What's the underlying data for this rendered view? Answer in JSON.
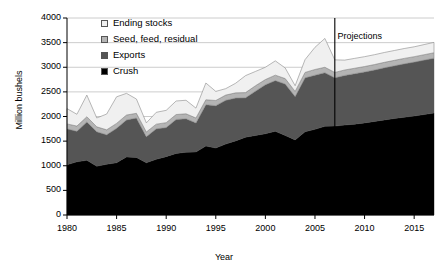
{
  "chart_data": {
    "type": "area",
    "title": "",
    "subtitle": "",
    "xlabel": "Year",
    "ylabel": "Million bushels",
    "xlim": [
      1980,
      2017
    ],
    "ylim": [
      0,
      4000
    ],
    "ytick_step": 500,
    "xtick_step": 5,
    "grid": true,
    "stacked": true,
    "legend_position": "top-left-inside",
    "yticks": [
      "0",
      "500",
      "1000",
      "1500",
      "2000",
      "2500",
      "3000",
      "3500",
      "4000"
    ],
    "xticks": [
      "1980",
      "1985",
      "1990",
      "1995",
      "2000",
      "2005",
      "2010",
      "2015"
    ],
    "x": [
      1980,
      1981,
      1982,
      1983,
      1984,
      1985,
      1986,
      1987,
      1988,
      1989,
      1990,
      1991,
      1992,
      1993,
      1994,
      1995,
      1996,
      1997,
      1998,
      1999,
      2000,
      2001,
      2002,
      2003,
      2004,
      2005,
      2006,
      2007,
      2008,
      2009,
      2010,
      2011,
      2012,
      2013,
      2014,
      2015,
      2016,
      2017
    ],
    "series": [
      {
        "name": "Crush",
        "color": "#000000",
        "values": [
          1020,
          1080,
          1110,
          990,
          1030,
          1060,
          1180,
          1170,
          1060,
          1130,
          1185,
          1250,
          1275,
          1280,
          1400,
          1360,
          1440,
          1505,
          1580,
          1615,
          1650,
          1700,
          1615,
          1525,
          1690,
          1740,
          1800,
          1805,
          1825,
          1845,
          1870,
          1900,
          1930,
          1960,
          1985,
          2010,
          2040,
          2070
        ]
      },
      {
        "name": "Exports",
        "color": "#555555",
        "values": [
          730,
          620,
          780,
          700,
          600,
          700,
          750,
          800,
          530,
          620,
          590,
          690,
          680,
          590,
          840,
          860,
          890,
          870,
          800,
          900,
          995,
          1030,
          1045,
          880,
          1095,
          1100,
          1090,
          980,
          1010,
          1025,
          1035,
          1045,
          1060,
          1070,
          1085,
          1095,
          1105,
          1115
        ]
      },
      {
        "name": "Seed, feed, residual",
        "color": "#b4b4b4",
        "values": [
          100,
          105,
          105,
          100,
          100,
          100,
          100,
          95,
          95,
          95,
          100,
          100,
          100,
          100,
          100,
          105,
          105,
          105,
          105,
          110,
          105,
          110,
          110,
          105,
          110,
          115,
          110,
          110,
          110,
          110,
          110,
          110,
          110,
          110,
          110,
          110,
          110,
          110
        ]
      },
      {
        "name": "Ending stocks",
        "color": "#f0f0f0",
        "values": [
          310,
          240,
          440,
          180,
          320,
          540,
          440,
          290,
          185,
          240,
          250,
          275,
          275,
          200,
          340,
          185,
          130,
          195,
          345,
          290,
          250,
          290,
          215,
          115,
          260,
          450,
          585,
          255,
          200,
          200,
          200,
          200,
          200,
          200,
          200,
          200,
          205,
          210
        ]
      }
    ],
    "annotations": [
      {
        "name": "projections-divider",
        "type": "vline",
        "x": 2007,
        "label": "Projections",
        "label_x": 2009.5,
        "label_y": 3640
      }
    ]
  },
  "legend": {
    "items": [
      {
        "label": "Ending stocks",
        "color": "#f0f0f0"
      },
      {
        "label": "Seed, feed, residual",
        "color": "#b4b4b4"
      },
      {
        "label": "Exports",
        "color": "#555555"
      },
      {
        "label": "Crush",
        "color": "#000000"
      }
    ]
  },
  "axes": {
    "ylabel": "Million bushels",
    "xlabel": "Year"
  },
  "annotation_text": {
    "projections": "Projections"
  }
}
